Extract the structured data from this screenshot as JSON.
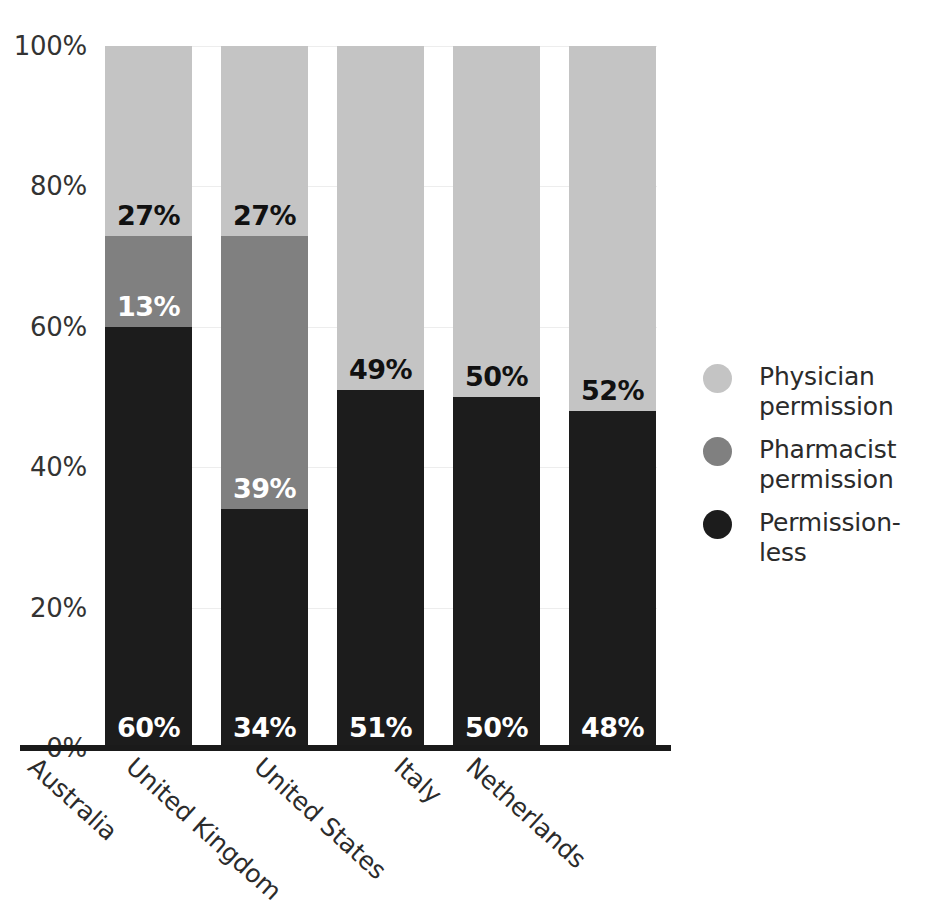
{
  "chart_data": {
    "type": "bar",
    "stacked": true,
    "normalized_percent": true,
    "title": "",
    "subtitle": "",
    "xlabel": "",
    "ylabel": "",
    "ylim": [
      0,
      100
    ],
    "ytick_labels": [
      "0%",
      "20%",
      "40%",
      "60%",
      "80%",
      "100%"
    ],
    "ytick_values": [
      0,
      20,
      40,
      60,
      80,
      100
    ],
    "grid": true,
    "grid_axis": "y",
    "legend_position": "right",
    "categories": [
      "Australia",
      "United Kingdom",
      "United States",
      "Italy",
      "Netherlands"
    ],
    "series": [
      {
        "name": "Permission-less",
        "color": "#1c1c1c",
        "values": [
          60,
          34,
          51,
          50,
          48
        ],
        "labels": [
          "60%",
          "34%",
          "51%",
          "50%",
          "48%"
        ]
      },
      {
        "name": "Pharmacist permission",
        "color": "#808080",
        "values": [
          13,
          39,
          0,
          0,
          0
        ],
        "labels": [
          "13%",
          "39%",
          "",
          "",
          ""
        ]
      },
      {
        "name": "Physician permission",
        "color": "#c4c4c4",
        "values": [
          27,
          27,
          49,
          50,
          52
        ],
        "labels": [
          "27%",
          "27%",
          "49%",
          "50%",
          "52%"
        ]
      }
    ]
  },
  "axis": {
    "ticks": [
      {
        "label": "100%",
        "value": 100
      },
      {
        "label": "80%",
        "value": 80
      },
      {
        "label": "60%",
        "value": 60
      },
      {
        "label": "40%",
        "value": 40
      },
      {
        "label": "20%",
        "value": 20
      },
      {
        "label": "0%",
        "value": 0
      }
    ]
  },
  "bars": [
    {
      "category": "Australia",
      "segments": [
        {
          "series": "Physician permission",
          "value": 27,
          "label": "27%",
          "class": "physician"
        },
        {
          "series": "Pharmacist permission",
          "value": 13,
          "label": "13%",
          "class": "pharmacist"
        },
        {
          "series": "Permission-less",
          "value": 60,
          "label": "60%",
          "class": "permissionless"
        }
      ]
    },
    {
      "category": "United Kingdom",
      "segments": [
        {
          "series": "Physician permission",
          "value": 27,
          "label": "27%",
          "class": "physician"
        },
        {
          "series": "Pharmacist permission",
          "value": 39,
          "label": "39%",
          "class": "pharmacist"
        },
        {
          "series": "Permission-less",
          "value": 34,
          "label": "34%",
          "class": "permissionless"
        }
      ]
    },
    {
      "category": "United States",
      "segments": [
        {
          "series": "Physician permission",
          "value": 49,
          "label": "49%",
          "class": "physician"
        },
        {
          "series": "Pharmacist permission",
          "value": 0,
          "label": "",
          "class": "pharmacist"
        },
        {
          "series": "Permission-less",
          "value": 51,
          "label": "51%",
          "class": "permissionless"
        }
      ]
    },
    {
      "category": "Italy",
      "segments": [
        {
          "series": "Physician permission",
          "value": 50,
          "label": "50%",
          "class": "physician"
        },
        {
          "series": "Pharmacist permission",
          "value": 0,
          "label": "",
          "class": "pharmacist"
        },
        {
          "series": "Permission-less",
          "value": 50,
          "label": "50%",
          "class": "permissionless"
        }
      ]
    },
    {
      "category": "Netherlands",
      "segments": [
        {
          "series": "Physician permission",
          "value": 52,
          "label": "52%",
          "class": "physician"
        },
        {
          "series": "Pharmacist permission",
          "value": 0,
          "label": "",
          "class": "pharmacist"
        },
        {
          "series": "Permission-less",
          "value": 48,
          "label": "48%",
          "class": "permissionless"
        }
      ]
    }
  ],
  "legend": {
    "items": [
      {
        "label": "Physician permission",
        "color": "#c4c4c4"
      },
      {
        "label": "Pharmacist permission",
        "color": "#808080"
      },
      {
        "label": "Permission-less",
        "color": "#1c1c1c"
      }
    ]
  },
  "colors": {
    "physician": "#c4c4c4",
    "pharmacist": "#808080",
    "permissionless": "#1c1c1c",
    "axis": "#1a1a1a",
    "grid": "#ededed",
    "text": "#2b2b2b"
  }
}
